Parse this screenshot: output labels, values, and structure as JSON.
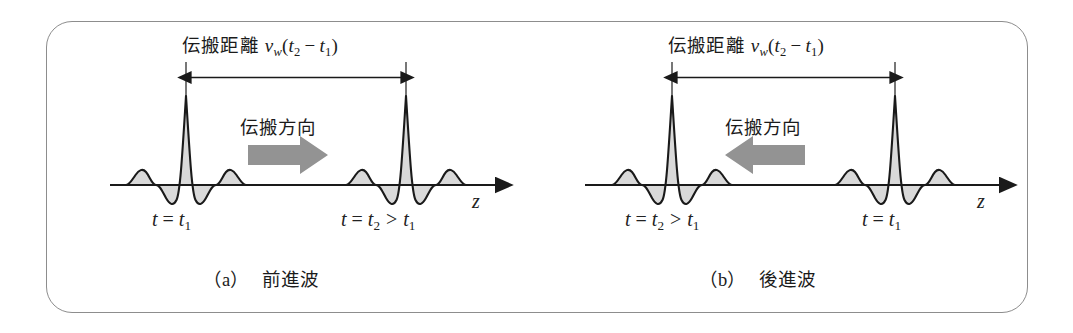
{
  "figure": {
    "border_color": "#8d8d8d",
    "background": "#ffffff",
    "wave_fill": "#d9d9d9",
    "wave_stroke": "#1a1a1a",
    "axis_color": "#1a1a1a",
    "arrow_gray": "#939393"
  },
  "panels": [
    {
      "id": "a",
      "caption_paren": "（a）",
      "caption_text": "前進波",
      "dimension": {
        "jp": "伝搬距離",
        "v": "v",
        "v_sub": "w",
        "open": "(",
        "t2": "t",
        "t2_sub": "2",
        "minus": "−",
        "t1": "t",
        "t1_sub": "1",
        "close": ")",
        "full": "伝搬距離 v_w(t₂ − t₁)"
      },
      "direction_label": "伝搬方向",
      "direction": "right",
      "axis_label": "z",
      "left_wave_label": {
        "t": "t",
        "eq": "=",
        "var": "t",
        "sub": "1",
        "full": "t = t₁"
      },
      "right_wave_label": {
        "t": "t",
        "eq": "=",
        "var": "t",
        "sub": "2",
        "gt": ">",
        "var2": "t",
        "sub2": "1",
        "full": "t = t₂ > t₁"
      }
    },
    {
      "id": "b",
      "caption_paren": "（b）",
      "caption_text": "後進波",
      "dimension": {
        "jp": "伝搬距離",
        "v": "v",
        "v_sub": "w",
        "open": "(",
        "t2": "t",
        "t2_sub": "2",
        "minus": "−",
        "t1": "t",
        "t1_sub": "1",
        "close": ")",
        "full": "伝搬距離 v_w(t₂ − t₁)"
      },
      "direction_label": "伝搬方向",
      "direction": "left",
      "axis_label": "z",
      "left_wave_label": {
        "t": "t",
        "eq": "=",
        "var": "t",
        "sub": "2",
        "gt": ">",
        "var2": "t",
        "sub2": "1",
        "full": "t = t₂ > t₁"
      },
      "right_wave_label": {
        "t": "t",
        "eq": "=",
        "var": "t",
        "sub": "1",
        "full": "t = t₁"
      }
    }
  ]
}
